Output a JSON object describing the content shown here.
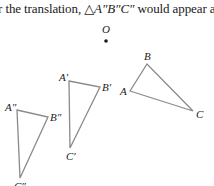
{
  "caption": {
    "prefix": "r the translation, ",
    "triangle_symbol": "△",
    "triangle_name": "A″B″C″",
    "suffix": " would appear a"
  },
  "point_o": {
    "label": "O",
    "x": 106,
    "y": 41
  },
  "triangles": [
    {
      "name": "ABC",
      "stroke": "#8a8a8a",
      "vertices": {
        "A": {
          "label": "A",
          "x": 130,
          "y": 91
        },
        "B": {
          "label": "B",
          "x": 147,
          "y": 64
        },
        "C": {
          "label": "C",
          "x": 193,
          "y": 111
        }
      }
    },
    {
      "name": "A′B′C′",
      "stroke": "#8a8a8a",
      "vertices": {
        "A": {
          "label": "A′",
          "x": 69,
          "y": 81
        },
        "B": {
          "label": "B′",
          "x": 100,
          "y": 87
        },
        "C": {
          "label": "C′",
          "x": 70,
          "y": 148
        }
      }
    },
    {
      "name": "A″B″C″",
      "stroke": "#8a8a8a",
      "vertices": {
        "A": {
          "label": "A″",
          "x": 17,
          "y": 110
        },
        "B": {
          "label": "B″",
          "x": 48,
          "y": 117
        },
        "C": {
          "label": "C″",
          "x": 20,
          "y": 178
        }
      }
    }
  ],
  "colors": {
    "line": "#8a8a8a",
    "text": "#1a1a1a",
    "background": "#ffffff"
  }
}
